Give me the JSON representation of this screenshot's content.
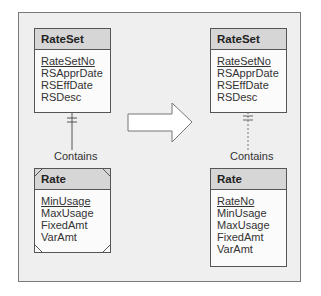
{
  "diagram": {
    "left": {
      "parent": {
        "name": "RateSet",
        "attributes": [
          {
            "label": "RateSetNo",
            "key": true
          },
          {
            "label": "RSApprDate",
            "key": false
          },
          {
            "label": "RSEffDate",
            "key": false
          },
          {
            "label": "RSDesc",
            "key": false
          }
        ]
      },
      "relationship": "Contains",
      "child": {
        "name": "Rate",
        "weak_entity": true,
        "attributes": [
          {
            "label": "MinUsage",
            "key": true
          },
          {
            "label": "MaxUsage",
            "key": false
          },
          {
            "label": "FixedAmt",
            "key": false
          },
          {
            "label": "VarAmt",
            "key": false
          }
        ]
      }
    },
    "transform_arrow": "right-arrow",
    "right": {
      "parent": {
        "name": "RateSet",
        "attributes": [
          {
            "label": "RateSetNo",
            "key": true
          },
          {
            "label": "RSApprDate",
            "key": false
          },
          {
            "label": "RSEffDate",
            "key": false
          },
          {
            "label": "RSDesc",
            "key": false
          }
        ]
      },
      "relationship": "Contains",
      "child": {
        "name": "Rate",
        "weak_entity": false,
        "attributes": [
          {
            "label": "RateNo",
            "key": true
          },
          {
            "label": "MinUsage",
            "key": false
          },
          {
            "label": "MaxUsage",
            "key": false
          },
          {
            "label": "FixedAmt",
            "key": false
          },
          {
            "label": "VarAmt",
            "key": false
          }
        ]
      }
    },
    "colors": {
      "frame_bg": "#efefef",
      "header_bg": "#d6d6d6",
      "line": "#555555"
    }
  }
}
